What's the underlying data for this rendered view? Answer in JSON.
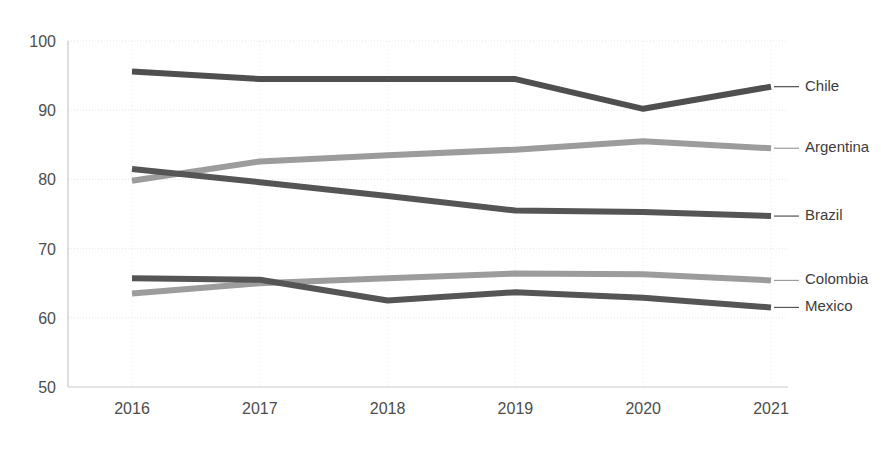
{
  "chart_data": {
    "type": "line",
    "title": "",
    "subtitle": "",
    "xlabel": "",
    "ylabel": "",
    "categories": [
      "2016",
      "2017",
      "2018",
      "2019",
      "2020",
      "2021"
    ],
    "x": [
      2016,
      2017,
      2018,
      2019,
      2020,
      2021
    ],
    "ylim": [
      50,
      100
    ],
    "yticks": [
      50,
      60,
      70,
      80,
      90,
      100
    ],
    "ytick_labels": [
      "50",
      "60",
      "70",
      "80",
      "90",
      "100"
    ],
    "xtick_labels": [
      "2016",
      "2017",
      "2018",
      "2019",
      "2020",
      "2021"
    ],
    "grid": true,
    "grid_horizontal": true,
    "grid_vertical": true,
    "legend_position": "right-inline-labels",
    "series": [
      {
        "name": "Chile",
        "color": "#4f4f4f",
        "values": [
          95.6,
          94.5,
          94.5,
          94.5,
          90.2,
          93.4
        ],
        "label": "Chile"
      },
      {
        "name": "Argentina",
        "color": "#9c9c9c",
        "values": [
          79.8,
          82.6,
          83.5,
          84.3,
          85.5,
          84.5
        ],
        "label": "Argentina"
      },
      {
        "name": "Brazil",
        "color": "#555555",
        "values": [
          81.5,
          79.6,
          77.6,
          75.5,
          75.3,
          74.7
        ],
        "label": "Brazil"
      },
      {
        "name": "Colombia",
        "color": "#9c9c9c",
        "values": [
          63.5,
          65.0,
          65.7,
          66.4,
          66.3,
          65.4
        ],
        "label": "Colombia"
      },
      {
        "name": "Mexico",
        "color": "#555555",
        "values": [
          65.7,
          65.5,
          62.5,
          63.7,
          62.9,
          61.5
        ],
        "label": "Mexico"
      }
    ],
    "label_y_positions": [
      93.4,
      84.5,
      74.7,
      65.4,
      61.5
    ]
  },
  "colors": {
    "dark_line": "#4f4f4f",
    "mid_line": "#555555",
    "light_line": "#9c9c9c",
    "gridline": "#e6e6e6",
    "axis": "#c9c9c9",
    "tick_text": "#4d4d4d",
    "label_text": "#3d3d3d",
    "background": "#ffffff"
  }
}
